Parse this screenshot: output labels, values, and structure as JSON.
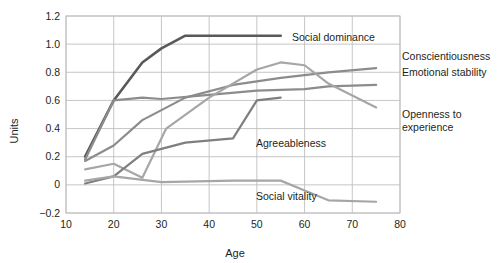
{
  "chart_data": {
    "type": "line",
    "title": "",
    "xlabel": "Age",
    "ylabel": "Units",
    "xlim": [
      10,
      80
    ],
    "ylim": [
      -0.2,
      1.2
    ],
    "xticks": [
      10,
      20,
      30,
      40,
      50,
      60,
      70,
      80
    ],
    "yticks": [
      -0.2,
      0,
      0.2,
      0.4,
      0.6,
      0.8,
      1.0,
      1.2
    ],
    "xtick_labels": [
      "10",
      "20",
      "30",
      "40",
      "50",
      "60",
      "70",
      "80"
    ],
    "ytick_labels": [
      "−0.2",
      "0",
      "0.2",
      "0.4",
      "0.6",
      "0.8",
      "1.0",
      "1.2"
    ],
    "grid": true,
    "legend_position": "inline-right",
    "series": [
      {
        "name": "Social dominance",
        "color": "#595959",
        "label_position": "inline-right-top",
        "x": [
          14,
          20,
          26,
          30,
          35,
          45,
          55
        ],
        "y": [
          0.2,
          0.6,
          0.87,
          0.97,
          1.06,
          1.06,
          1.06
        ]
      },
      {
        "name": "Conscientiousness",
        "color": "#8c8c8c",
        "label_position": "right",
        "x": [
          14,
          20,
          26,
          35,
          45,
          55,
          65,
          75
        ],
        "y": [
          0.17,
          0.28,
          0.46,
          0.62,
          0.71,
          0.76,
          0.8,
          0.83
        ]
      },
      {
        "name": "Emotional stability",
        "color": "#8c8c8c",
        "label_position": "right",
        "x": [
          14,
          20,
          26,
          30,
          40,
          50,
          60,
          65,
          75
        ],
        "y": [
          0.18,
          0.6,
          0.62,
          0.61,
          0.64,
          0.67,
          0.68,
          0.7,
          0.71
        ]
      },
      {
        "name": "Openness to experience",
        "color": "#a6a6a6",
        "label_position": "right",
        "x": [
          14,
          20,
          26,
          31,
          40,
          50,
          55,
          60,
          65,
          75
        ],
        "y": [
          0.11,
          0.15,
          0.05,
          0.4,
          0.62,
          0.82,
          0.87,
          0.85,
          0.72,
          0.55
        ]
      },
      {
        "name": "Agreeableness",
        "color": "#7f7f7f",
        "label_position": "inline-right",
        "x": [
          14,
          20,
          26,
          35,
          45,
          50,
          55
        ],
        "y": [
          0.01,
          0.06,
          0.22,
          0.3,
          0.33,
          0.6,
          0.62
        ]
      },
      {
        "name": "Social vitality",
        "color": "#a6a6a6",
        "label_position": "inline-right",
        "x": [
          14,
          20,
          30,
          45,
          55,
          60,
          65,
          75
        ],
        "y": [
          0.03,
          0.06,
          0.02,
          0.03,
          0.03,
          -0.04,
          -0.11,
          -0.12
        ]
      }
    ],
    "inline_labels": [
      {
        "text": "Social dominance",
        "anchor_x": 292,
        "anchor_y": 41
      },
      {
        "text": "Agreeableness",
        "anchor_x": 256,
        "anchor_y": 147
      },
      {
        "text": "Social vitality",
        "anchor_x": 256,
        "anchor_y": 200
      }
    ],
    "right_labels": [
      {
        "text": "Conscientiousness",
        "anchor_x": 402,
        "anchor_y": 60
      },
      {
        "text": "Emotional stability",
        "anchor_x": 402,
        "anchor_y": 76
      },
      {
        "text": "Openness to",
        "anchor_x": 402,
        "anchor_y": 118
      },
      {
        "text": "experience",
        "anchor_x": 402,
        "anchor_y": 131
      }
    ],
    "colors": {
      "grid": "#bfbfbf",
      "plot_border": "#bfbfbf",
      "background": "#ffffff",
      "text": "#231f20"
    }
  }
}
